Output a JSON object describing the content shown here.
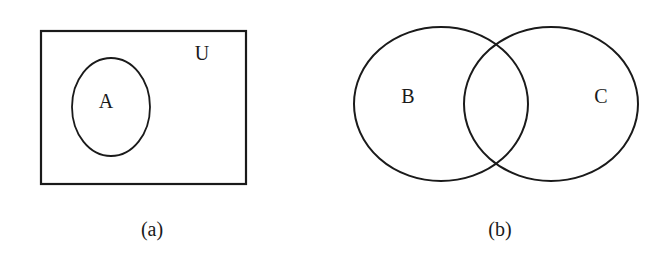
{
  "figure": {
    "panels": [
      {
        "id": "a",
        "caption": "(a)",
        "universe_label": "U",
        "sets": [
          {
            "label": "A",
            "description": "set A contained within universal set U"
          }
        ]
      },
      {
        "id": "b",
        "caption": "(b)",
        "sets": [
          {
            "label": "B"
          },
          {
            "label": "C"
          }
        ],
        "relationship": "B and C overlap (intersecting sets)"
      }
    ],
    "colors": {
      "stroke": "#1a1a1a",
      "background": "#ffffff"
    }
  }
}
